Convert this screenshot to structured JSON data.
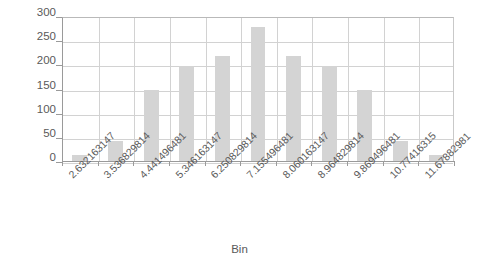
{
  "chart_data": {
    "type": "bar",
    "title": "",
    "subtitle": "",
    "xlabel": "Bin",
    "ylabel": "Frequency",
    "ylim": [
      0,
      300
    ],
    "ytick_values": [
      0,
      50,
      100,
      150,
      200,
      250,
      300
    ],
    "ytick_labels": [
      "0",
      "50",
      "100",
      "150",
      "200",
      "250",
      "300"
    ],
    "grid": "horizontal-and-vertical",
    "legend": "none",
    "bar_color": "#d4d4d4",
    "axis_color": "#9a9a9a",
    "grid_color": "#d2d2d2",
    "text_color": "#5a5a5a",
    "categories": [
      "2.632163147",
      "3.536829814",
      "4.441496481",
      "5.346163147",
      "6.250829814",
      "7.155496481",
      "8.060163147",
      "8.964829814",
      "9.869496481",
      "10.77416315",
      "11.67882981"
    ],
    "values": [
      15,
      43,
      150,
      199,
      219,
      279,
      219,
      199,
      149,
      43,
      14
    ]
  }
}
